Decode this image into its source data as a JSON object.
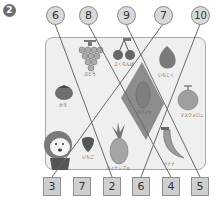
{
  "problem": {
    "number": "2"
  },
  "top_numbers": [
    "6",
    "8",
    "9",
    "7",
    "10"
  ],
  "bottom_numbers": [
    "3",
    "7",
    "2",
    "6",
    "4",
    "5"
  ],
  "fruits": {
    "grapes": "ぶどう",
    "cherries": "さくらんぼ",
    "fig": "いちじく",
    "persimmon": "かき",
    "papaya": "パパイヤ",
    "melon": "マスクメロン",
    "pineapple": "パイナップル",
    "strawberry": "いちご",
    "banana": "バナナ"
  },
  "colors": {
    "box_fill": "#efefef",
    "shaded_region": "#8c8c8c",
    "line": "#6a6a6a",
    "badge_fill": "#d9d9d9"
  }
}
